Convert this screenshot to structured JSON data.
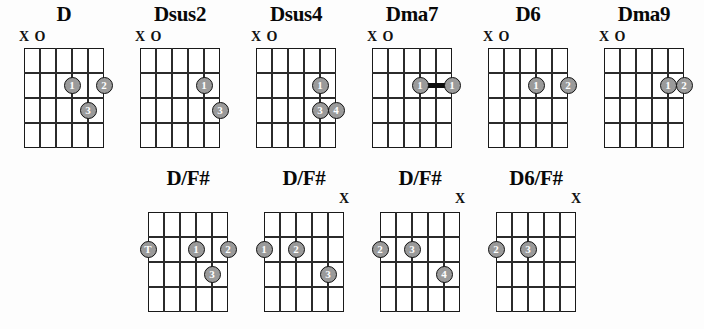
{
  "sheet": {
    "title": "D chord voicings chart",
    "string_count": 6,
    "fret_count": 4,
    "colors": {
      "line": "#2b2b2b",
      "dot_fill": "#9a9a9a",
      "dot_border": "#101010",
      "dot_text": "#ffffff",
      "background": "#ffffff"
    }
  },
  "rows": [
    {
      "name": "top-row",
      "chords": [
        {
          "name": "D",
          "open_marks": [
            {
              "string": 6,
              "symbol": "X"
            },
            {
              "string": 5,
              "symbol": "O"
            }
          ],
          "dots": [
            {
              "string": 3,
              "fret": 2,
              "finger": "1"
            },
            {
              "string": 1,
              "fret": 2,
              "finger": "2"
            },
            {
              "string": 2,
              "fret": 3,
              "finger": "3"
            }
          ],
          "barres": []
        },
        {
          "name": "Dsus2",
          "open_marks": [
            {
              "string": 6,
              "symbol": "X"
            },
            {
              "string": 5,
              "symbol": "O"
            }
          ],
          "dots": [
            {
              "string": 2,
              "fret": 2,
              "finger": "1"
            },
            {
              "string": 1,
              "fret": 3,
              "finger": "3"
            }
          ],
          "barres": []
        },
        {
          "name": "Dsus4",
          "open_marks": [
            {
              "string": 6,
              "symbol": "X"
            },
            {
              "string": 5,
              "symbol": "O"
            }
          ],
          "dots": [
            {
              "string": 2,
              "fret": 2,
              "finger": "1"
            },
            {
              "string": 2,
              "fret": 3,
              "finger": "3"
            },
            {
              "string": 1,
              "fret": 3,
              "finger": "4"
            }
          ],
          "barres": []
        },
        {
          "name": "Dma7",
          "open_marks": [
            {
              "string": 6,
              "symbol": "X"
            },
            {
              "string": 5,
              "symbol": "O"
            }
          ],
          "dots": [
            {
              "string": 3,
              "fret": 2,
              "finger": "1"
            },
            {
              "string": 1,
              "fret": 2,
              "finger": "1"
            }
          ],
          "barres": [
            {
              "fret": 2,
              "from_string": 3,
              "to_string": 1,
              "finger": "1"
            }
          ]
        },
        {
          "name": "D6",
          "open_marks": [
            {
              "string": 6,
              "symbol": "X"
            },
            {
              "string": 5,
              "symbol": "O"
            }
          ],
          "dots": [
            {
              "string": 3,
              "fret": 2,
              "finger": "1"
            },
            {
              "string": 1,
              "fret": 2,
              "finger": "2"
            }
          ],
          "barres": []
        },
        {
          "name": "Dma9",
          "open_marks": [
            {
              "string": 6,
              "symbol": "X"
            },
            {
              "string": 5,
              "symbol": "O"
            }
          ],
          "dots": [
            {
              "string": 2,
              "fret": 2,
              "finger": "1"
            },
            {
              "string": 1,
              "fret": 2,
              "finger": "2"
            }
          ],
          "barres": []
        }
      ]
    },
    {
      "name": "bottom-row",
      "chords": [
        {
          "name": "D/F#",
          "open_marks": [],
          "dots": [
            {
              "string": 6,
              "fret": 2,
              "finger": "T"
            },
            {
              "string": 3,
              "fret": 2,
              "finger": "1"
            },
            {
              "string": 1,
              "fret": 2,
              "finger": "2"
            },
            {
              "string": 2,
              "fret": 3,
              "finger": "3"
            }
          ],
          "barres": []
        },
        {
          "name": "D/F#",
          "open_marks": [
            {
              "string": 1,
              "symbol": "X"
            }
          ],
          "dots": [
            {
              "string": 6,
              "fret": 2,
              "finger": "1"
            },
            {
              "string": 4,
              "fret": 2,
              "finger": "2"
            },
            {
              "string": 2,
              "fret": 3,
              "finger": "3"
            }
          ],
          "barres": []
        },
        {
          "name": "D/F#",
          "open_marks": [
            {
              "string": 1,
              "symbol": "X"
            }
          ],
          "dots": [
            {
              "string": 6,
              "fret": 2,
              "finger": "2"
            },
            {
              "string": 4,
              "fret": 2,
              "finger": "3"
            },
            {
              "string": 2,
              "fret": 3,
              "finger": "4"
            }
          ],
          "barres": []
        },
        {
          "name": "D6/F#",
          "open_marks": [
            {
              "string": 1,
              "symbol": "X"
            }
          ],
          "dots": [
            {
              "string": 6,
              "fret": 2,
              "finger": "2"
            },
            {
              "string": 4,
              "fret": 2,
              "finger": "3"
            }
          ],
          "barres": []
        }
      ]
    }
  ]
}
